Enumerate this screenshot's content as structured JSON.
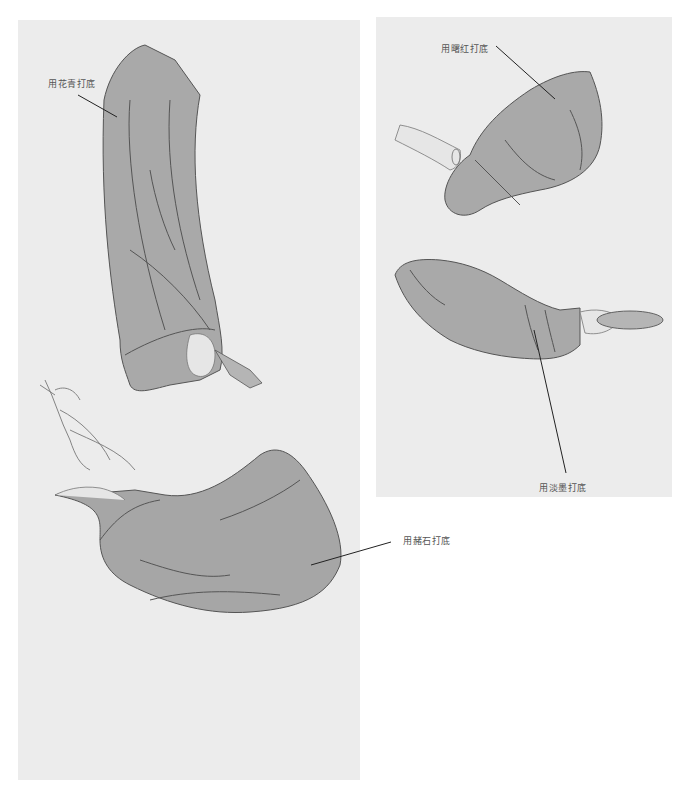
{
  "panels": [
    {
      "id": "left",
      "figures": [
        {
          "name": "upper-sleeve",
          "description": "hanging sleeve holding a cup",
          "annotation": "用花青打底"
        },
        {
          "name": "lower-sleeve",
          "description": "sleeve with hand holding a branch",
          "annotation": "用赭石打底"
        }
      ]
    },
    {
      "id": "right",
      "figures": [
        {
          "name": "upper-sleeve",
          "description": "sleeve with pointing hand and bracelet",
          "annotation": "用曙红打底"
        },
        {
          "name": "lower-sleeve",
          "description": "sleeve with hand holding a plate",
          "annotation": "用淡墨打底"
        }
      ]
    }
  ],
  "labels": {
    "huaqing": "用花青打底",
    "shuhong": "用曙红打底",
    "danmo": "用淡墨打底",
    "zheshi": "用赭石打底"
  },
  "colors": {
    "background": "#ffffff",
    "panel": "#ececec",
    "sleeve_fill": "#a9a9a9",
    "outline": "#555555"
  }
}
